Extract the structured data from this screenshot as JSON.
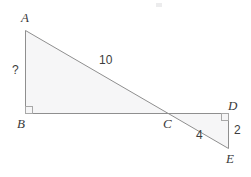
{
  "figure": {
    "canvas": {
      "width": 251,
      "height": 177,
      "background": "#ffffff"
    },
    "style": {
      "stroke_color": "#8f8f8f",
      "stroke_width": 1,
      "fill_color": "#f6f6f7",
      "label_color": "#3a3a3a",
      "right_angle_color": "#a8a8a8"
    },
    "points": {
      "A": {
        "x": 25,
        "y": 30
      },
      "B": {
        "x": 25,
        "y": 113
      },
      "C": {
        "x": 168,
        "y": 113
      },
      "D": {
        "x": 228,
        "y": 113
      },
      "E": {
        "x": 228,
        "y": 148
      }
    },
    "vertex_labels": [
      {
        "name": "vertex-label-A",
        "text": "A",
        "x": 21,
        "y": 11
      },
      {
        "name": "vertex-label-B",
        "text": "B",
        "x": 17,
        "y": 117
      },
      {
        "name": "vertex-label-C",
        "text": "C",
        "x": 163,
        "y": 117
      },
      {
        "name": "vertex-label-D",
        "text": "D",
        "x": 228,
        "y": 99
      },
      {
        "name": "vertex-label-E",
        "text": "E",
        "x": 226,
        "y": 152
      }
    ],
    "measure_labels": [
      {
        "name": "side-label-ab",
        "text": "?",
        "x": 12,
        "y": 64
      },
      {
        "name": "side-label-ac",
        "text": "10",
        "x": 99,
        "y": 54
      },
      {
        "name": "side-label-ce",
        "text": "4",
        "x": 196,
        "y": 129
      },
      {
        "name": "side-label-de",
        "text": "2",
        "x": 234,
        "y": 124
      }
    ],
    "right_angles": [
      {
        "name": "right-angle-mark-b",
        "x": 25,
        "y": 106,
        "size": 7
      },
      {
        "name": "right-angle-mark-d",
        "x": 221,
        "y": 113,
        "size": 7
      }
    ],
    "artifact": {
      "name": "scan-speck",
      "x": 156,
      "y": 3
    }
  }
}
